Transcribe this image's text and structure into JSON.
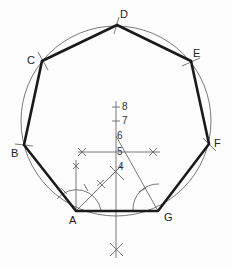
{
  "diagram": {
    "type": "geometric-construction",
    "colors": {
      "thin_line": "#555555",
      "thick_line": "#1a1a1a",
      "label": "#222222",
      "background": "#fdfdfd"
    },
    "circle": {
      "cx": 116,
      "cy": 121,
      "r": 95
    },
    "vertices": [
      {
        "id": "A",
        "label": "A",
        "x": 76,
        "y": 211,
        "lx": 69,
        "ly": 215
      },
      {
        "id": "B",
        "label": "B",
        "x": 24,
        "y": 145,
        "lx": 11,
        "ly": 148
      },
      {
        "id": "C",
        "label": "C",
        "x": 42,
        "y": 61,
        "lx": 27,
        "ly": 55
      },
      {
        "id": "D",
        "label": "D",
        "x": 117,
        "y": 25,
        "lx": 120,
        "ly": 9
      },
      {
        "id": "E",
        "label": "E",
        "x": 191,
        "y": 61,
        "lx": 193,
        "ly": 48
      },
      {
        "id": "F",
        "label": "F",
        "x": 209,
        "y": 144,
        "lx": 214,
        "ly": 138
      },
      {
        "id": "G",
        "label": "G",
        "x": 158,
        "y": 211,
        "lx": 164,
        "ly": 212
      }
    ],
    "axis_points": [
      {
        "label": "8",
        "x": 116,
        "y": 107
      },
      {
        "label": "7",
        "x": 116,
        "y": 121
      },
      {
        "label": "6",
        "x": 116,
        "y": 136
      },
      {
        "label": "5",
        "x": 116,
        "y": 152
      },
      {
        "label": "4",
        "x": 116,
        "y": 168
      }
    ]
  }
}
